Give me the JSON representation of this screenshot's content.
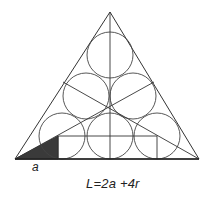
{
  "diagram": {
    "label_a": "a",
    "formula": "L=2a +4r",
    "colors": {
      "stroke": "#333333",
      "shaded": "#3a3a3a",
      "background": "#ffffff"
    },
    "triangle": {
      "apex": [
        110,
        12
      ],
      "left": [
        15,
        159
      ],
      "right": [
        199,
        159
      ]
    },
    "circles": [
      {
        "cx": 110,
        "cy": 55,
        "r": 23
      },
      {
        "cx": 86,
        "cy": 96,
        "r": 23
      },
      {
        "cx": 133,
        "cy": 96,
        "r": 23
      },
      {
        "cx": 62,
        "cy": 136,
        "r": 23
      },
      {
        "cx": 110,
        "cy": 136,
        "r": 23
      },
      {
        "cx": 157,
        "cy": 136,
        "r": 23
      }
    ]
  }
}
